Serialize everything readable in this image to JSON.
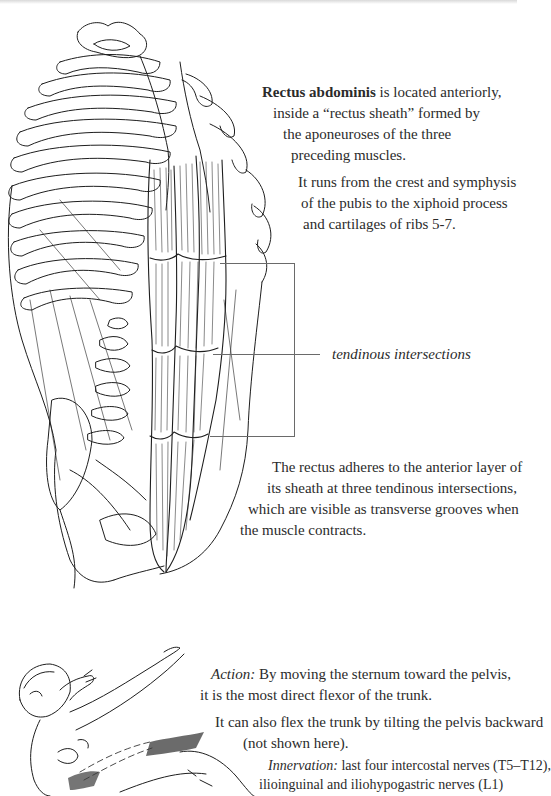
{
  "page": {
    "paragraphs": {
      "intro": {
        "term": "Rectus abdominis",
        "lines": [
          " is located anteriorly,",
          "inside a “rectus sheath” formed by",
          "the aponeuroses of the three",
          "preceding muscles."
        ]
      },
      "attachments": {
        "lines": [
          "It runs from the crest and symphysis",
          "of the pubis to the xiphoid process",
          "and cartilages of ribs 5-7."
        ]
      },
      "label": {
        "text": "tendinous intersections"
      },
      "intersections": {
        "lines": [
          "The rectus adheres to the anterior layer of",
          "its sheath at three tendinous intersections,",
          "which are visible as transverse grooves when",
          "the muscle contracts."
        ]
      },
      "action": {
        "term": "Action:",
        "lines": [
          " By moving the sternum toward the pelvis,",
          "it is the most direct flexor of the trunk."
        ]
      },
      "pelvis": {
        "lines": [
          "It can also flex the trunk by tilting the pelvis backward",
          "(not shown here)."
        ]
      },
      "innervation": {
        "term": "Innervation:",
        "lines": [
          " last four intercostal nerves (T5–T12),",
          "ilioinguinal and iliohypogastric nerves (L1)"
        ]
      }
    },
    "figures": {
      "torso": "rib-cage-and-rectus-abdominis-illustration",
      "pose": "figure-flexing-trunk-illustration"
    },
    "colors": {
      "text": "#2b2b2b",
      "line_art": "#1e1e1e",
      "leader_line": "#6a6a6a",
      "background": "#ffffff"
    }
  }
}
